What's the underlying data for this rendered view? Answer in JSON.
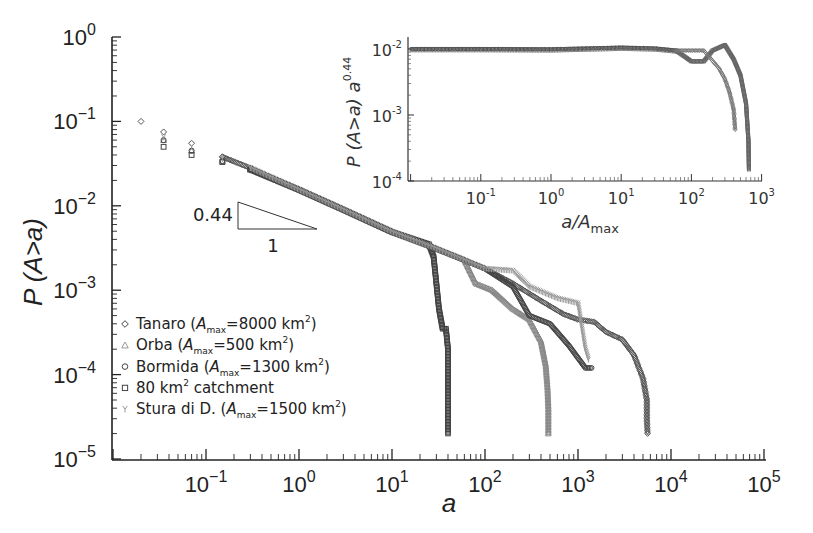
{
  "chart_data": [
    {
      "id": "main",
      "type": "scatter",
      "title": "",
      "xlabel": "a",
      "ylabel": "P (A>a)",
      "xscale": "log",
      "yscale": "log",
      "xlim": [
        0.01,
        100000
      ],
      "ylim": [
        1e-05,
        1
      ],
      "x_tick_labels": [
        "10^-1",
        "10^0",
        "10^1",
        "10^2",
        "10^3",
        "10^4",
        "10^5"
      ],
      "y_tick_labels": [
        "10^0",
        "10^-1",
        "10^-2",
        "10^-3",
        "10^-4",
        "10^-5"
      ],
      "grid": false,
      "legend_position": "lower-left",
      "annotation": {
        "type": "slope-triangle",
        "rise_label": "0.44",
        "run_label": "1"
      },
      "series": [
        {
          "name": "Tanaro (A_max=8000 km²)",
          "marker": "diamond",
          "color": "#555555",
          "points": [
            [
              0.02,
              0.1
            ],
            [
              0.035,
              0.075
            ],
            [
              0.07,
              0.055
            ],
            [
              0.15,
              0.038
            ],
            [
              0.3,
              0.028
            ],
            [
              1,
              0.0155
            ],
            [
              3,
              0.009
            ],
            [
              10,
              0.0049
            ],
            [
              30,
              0.0031
            ],
            [
              100,
              0.0018
            ],
            [
              200,
              0.0012
            ],
            [
              400,
              0.00075
            ],
            [
              700,
              0.00052
            ],
            [
              1000,
              0.00045
            ],
            [
              1500,
              0.00042
            ],
            [
              2000,
              0.00032
            ],
            [
              3000,
              0.00026
            ],
            [
              4000,
              0.00017
            ],
            [
              5000,
              9e-05
            ],
            [
              5500,
              5e-05
            ],
            [
              5500,
              3e-05
            ],
            [
              5600,
              2e-05
            ]
          ]
        },
        {
          "name": "Orba (A_max=500 km²)",
          "marker": "triangle",
          "color": "#888888",
          "points": [
            [
              0.035,
              0.06
            ],
            [
              0.07,
              0.045
            ],
            [
              0.15,
              0.034
            ],
            [
              0.3,
              0.027
            ],
            [
              1,
              0.0155
            ],
            [
              3,
              0.009
            ],
            [
              10,
              0.0049
            ],
            [
              30,
              0.0031
            ],
            [
              60,
              0.0023
            ],
            [
              80,
              0.0012
            ],
            [
              120,
              0.001
            ],
            [
              200,
              0.0006
            ],
            [
              300,
              0.00045
            ],
            [
              400,
              0.00025
            ],
            [
              450,
              0.00013
            ],
            [
              470,
              7e-05
            ],
            [
              480,
              4e-05
            ],
            [
              480,
              2e-05
            ]
          ]
        },
        {
          "name": "Bormida (A_max=1300 km²)",
          "marker": "circle",
          "color": "#444444",
          "points": [
            [
              0.035,
              0.06
            ],
            [
              0.07,
              0.045
            ],
            [
              0.15,
              0.034
            ],
            [
              0.3,
              0.027
            ],
            [
              1,
              0.0155
            ],
            [
              3,
              0.009
            ],
            [
              10,
              0.0049
            ],
            [
              30,
              0.0031
            ],
            [
              100,
              0.0018
            ],
            [
              200,
              0.0011
            ],
            [
              300,
              0.0005
            ],
            [
              500,
              0.0004
            ],
            [
              800,
              0.00022
            ],
            [
              1200,
              0.00012
            ],
            [
              1400,
              0.00012
            ]
          ]
        },
        {
          "name": "80 km² catchment",
          "marker": "square",
          "color": "#444444",
          "points": [
            [
              0.035,
              0.05
            ],
            [
              0.07,
              0.04
            ],
            [
              0.15,
              0.033
            ],
            [
              0.3,
              0.027
            ],
            [
              1,
              0.0155
            ],
            [
              3,
              0.009
            ],
            [
              10,
              0.0049
            ],
            [
              25,
              0.0035
            ],
            [
              28,
              0.0025
            ],
            [
              30,
              0.0012
            ],
            [
              32,
              0.0006
            ],
            [
              35,
              0.00035
            ],
            [
              38,
              0.00035
            ],
            [
              40,
              0.0002
            ],
            [
              40,
              0.0001
            ],
            [
              40,
              6e-05
            ],
            [
              40,
              3e-05
            ],
            [
              40,
              2e-05
            ]
          ]
        },
        {
          "name": "Stura di D. (A_max=1500 km²)",
          "marker": "x",
          "color": "#999999",
          "points": [
            [
              0.035,
              0.065
            ],
            [
              0.07,
              0.05
            ],
            [
              0.15,
              0.036
            ],
            [
              0.3,
              0.028
            ],
            [
              1,
              0.0155
            ],
            [
              3,
              0.009
            ],
            [
              10,
              0.0049
            ],
            [
              30,
              0.0031
            ],
            [
              100,
              0.0018
            ],
            [
              200,
              0.0017
            ],
            [
              300,
              0.0011
            ],
            [
              600,
              0.0008
            ],
            [
              1000,
              0.0007
            ],
            [
              1200,
              0.0002
            ],
            [
              1300,
              0.00015
            ]
          ]
        }
      ]
    },
    {
      "id": "inset",
      "type": "scatter",
      "title": "",
      "xlabel": "a/A_max",
      "ylabel": "P (A>a) a^0.44",
      "xscale": "log",
      "yscale": "log",
      "xlim": [
        0.01,
        1000
      ],
      "ylim": [
        0.0001,
        0.02
      ],
      "x_tick_labels": [
        "10^-1",
        "10^0",
        "10^1",
        "10^2",
        "10^3"
      ],
      "y_tick_labels": [
        "10^-2",
        "10^-3",
        "10^-4"
      ],
      "grid": false,
      "series": [
        {
          "name": "collapse-flat",
          "marker": "mixed",
          "color": "#555555",
          "points": [
            [
              0.01,
              0.01
            ],
            [
              0.1,
              0.01
            ],
            [
              1,
              0.0099
            ],
            [
              10,
              0.0105
            ],
            [
              30,
              0.0102
            ],
            [
              60,
              0.0095
            ]
          ]
        },
        {
          "name": "collapse-tail-a",
          "marker": "square",
          "color": "#666666",
          "points": [
            [
              60,
              0.0095
            ],
            [
              100,
              0.0065
            ],
            [
              150,
              0.0065
            ],
            [
              200,
              0.0095
            ],
            [
              300,
              0.0115
            ],
            [
              400,
              0.007
            ],
            [
              500,
              0.004
            ],
            [
              600,
              0.0015
            ],
            [
              650,
              0.0004
            ],
            [
              660,
              0.00015
            ]
          ]
        },
        {
          "name": "collapse-tail-b",
          "marker": "diamond",
          "color": "#777777",
          "points": [
            [
              60,
              0.0095
            ],
            [
              150,
              0.0095
            ],
            [
              250,
              0.005
            ],
            [
              300,
              0.0035
            ],
            [
              350,
              0.0022
            ],
            [
              400,
              0.0012
            ],
            [
              420,
              0.0006
            ]
          ]
        }
      ]
    }
  ],
  "legend": {
    "items": [
      {
        "marker": "diamond",
        "label": "Tanaro (",
        "sym": "A",
        "sub": "max",
        "rest": "=8000 km",
        "sup": "2",
        "end": ")"
      },
      {
        "marker": "triangle",
        "label": "Orba (",
        "sym": "A",
        "sub": "max",
        "rest": "=500 km",
        "sup": "2",
        "end": ")"
      },
      {
        "marker": "circle",
        "label": "Bormida (",
        "sym": "A",
        "sub": "max",
        "rest": "=1300 km",
        "sup": "2",
        "end": ")"
      },
      {
        "marker": "square",
        "label": "80 km",
        "sym": "",
        "sub": "",
        "rest": "",
        "sup": "2",
        "end": " catchment"
      },
      {
        "marker": "x",
        "label": "Stura di D. (",
        "sym": "A",
        "sub": "max",
        "rest": "=1500 km",
        "sup": "2",
        "end": ")"
      }
    ]
  },
  "main_axes": {
    "y_title": "P (A>a)",
    "x_title": "a",
    "y_ticks": [
      {
        "base": "10",
        "exp": "0"
      },
      {
        "base": "10",
        "exp": "−1"
      },
      {
        "base": "10",
        "exp": "−2"
      },
      {
        "base": "10",
        "exp": "−3"
      },
      {
        "base": "10",
        "exp": "−4"
      },
      {
        "base": "10",
        "exp": "−5"
      }
    ],
    "x_ticks": [
      {
        "base": "10",
        "exp": "−1"
      },
      {
        "base": "10",
        "exp": "0"
      },
      {
        "base": "10",
        "exp": "1"
      },
      {
        "base": "10",
        "exp": "2"
      },
      {
        "base": "10",
        "exp": "3"
      },
      {
        "base": "10",
        "exp": "4"
      },
      {
        "base": "10",
        "exp": "5"
      }
    ]
  },
  "inset_axes": {
    "y_title_main": "P (A>a) a",
    "y_title_exp": "0.44",
    "x_title_main": "a/A",
    "x_title_sub": "max",
    "y_ticks": [
      {
        "base": "10",
        "exp": "-2"
      },
      {
        "base": "10",
        "exp": "-3"
      },
      {
        "base": "10",
        "exp": "-4"
      }
    ],
    "x_ticks": [
      {
        "base": "10",
        "exp": "-1"
      },
      {
        "base": "10",
        "exp": "0"
      },
      {
        "base": "10",
        "exp": "1"
      },
      {
        "base": "10",
        "exp": "2"
      },
      {
        "base": "10",
        "exp": "3"
      }
    ]
  },
  "slope_triangle": {
    "rise": "0.44",
    "run": "1"
  }
}
